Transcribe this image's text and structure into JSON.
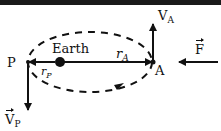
{
  "diagram": {
    "type": "orbit-diagram",
    "colors": {
      "ink": "#111111",
      "background": "#ffffff",
      "top_bar": "#1a1a1a"
    },
    "labels": {
      "earth": "Earth",
      "point_p": "P",
      "point_a": "A",
      "r_a": {
        "base": "r",
        "sub": "A"
      },
      "r_p": {
        "base": "r",
        "sub": "P"
      },
      "v_a": {
        "base": "V",
        "sub": "A"
      },
      "v_p": {
        "base": "V",
        "sub": "P"
      },
      "force": "F"
    },
    "elements": [
      {
        "id": "orbit",
        "shape": "dashed-ellipse",
        "cx": 90,
        "cy": 62,
        "rx": 62,
        "ry": 30
      },
      {
        "id": "earth",
        "shape": "filled-circle",
        "cx": 60,
        "cy": 62,
        "r": 5
      },
      {
        "id": "r_a_vector",
        "shape": "arrow",
        "from": [
          60,
          62
        ],
        "to": [
          153,
          62
        ]
      },
      {
        "id": "r_p_vector",
        "shape": "arrow",
        "from": [
          55,
          62
        ],
        "to": [
          28,
          62
        ]
      },
      {
        "id": "v_a_vector",
        "shape": "arrow",
        "from": [
          153,
          62
        ],
        "to": [
          153,
          24
        ]
      },
      {
        "id": "v_p_vector",
        "shape": "arrow",
        "from": [
          28,
          62
        ],
        "to": [
          28,
          110
        ]
      },
      {
        "id": "force_vector",
        "shape": "arrow",
        "from": [
          218,
          62
        ],
        "to": [
          178,
          62
        ]
      }
    ]
  }
}
